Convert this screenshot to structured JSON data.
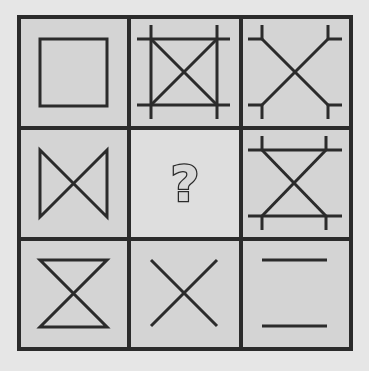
{
  "puzzle": {
    "type": "3x3 visual reasoning matrix",
    "colors": {
      "line": "#2b2b2b",
      "cell_fill": "#d4d4d4",
      "blank_fill": "#dedede",
      "background": "#e6e6e6"
    },
    "cells": [
      {
        "row": 1,
        "col": 1,
        "description": "square outline"
      },
      {
        "row": 1,
        "col": 2,
        "description": "square with both diagonals; all four sides extended past corners"
      },
      {
        "row": 1,
        "col": 3,
        "description": "X (two diagonals) with short perpendicular tick marks at each of the four corners"
      },
      {
        "row": 2,
        "col": 1,
        "description": "bowtie: two diagonals plus left and right vertical sides"
      },
      {
        "row": 2,
        "col": 2,
        "description": "missing cell",
        "label": "?"
      },
      {
        "row": 2,
        "col": 3,
        "description": "hourglass with top and bottom sides extended; short vertical ticks at the four corners"
      },
      {
        "row": 3,
        "col": 1,
        "description": "hourglass: two diagonals plus top and bottom horizontal sides"
      },
      {
        "row": 3,
        "col": 2,
        "description": "X: two diagonals only"
      },
      {
        "row": 3,
        "col": 3,
        "description": "two horizontal lines (top and bottom)"
      }
    ],
    "question_label": "?"
  }
}
